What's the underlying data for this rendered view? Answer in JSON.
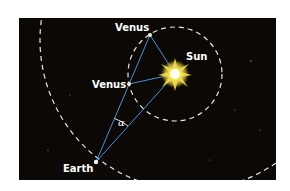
{
  "diagram": {
    "labels": {
      "venus_top": "Venus",
      "venus_left": "Venus",
      "sun": "Sun",
      "earth": "Earth",
      "angle": "α"
    },
    "colors": {
      "background": "#0b0806",
      "orbit": "#ffffff",
      "sight_lines": "#4f8fd6",
      "sun_core": "#fffbe0",
      "sun_glow": "#f5e04a"
    },
    "bodies": {
      "sun": {
        "x": 175,
        "y": 74
      },
      "venus_top": {
        "x": 150,
        "y": 35
      },
      "venus_left": {
        "x": 129,
        "y": 84
      },
      "earth": {
        "x": 96,
        "y": 162
      }
    },
    "orbits": {
      "venus_orbit": {
        "cx": 175,
        "cy": 74,
        "r": 47
      },
      "earth_orbit": {
        "cx": 190,
        "cy": 40,
        "r": 150
      }
    }
  }
}
